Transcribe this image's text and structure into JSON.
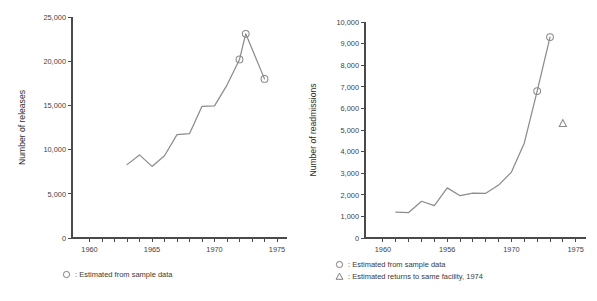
{
  "figures": [
    {
      "id": "releases",
      "legend": [
        {
          "glyph": "circle-marker-icon",
          "text": ": Estimated from sample data"
        }
      ]
    },
    {
      "id": "readmissions",
      "legend": [
        {
          "glyph": "circle-marker-icon",
          "text": ": Estimated from sample data"
        },
        {
          "glyph": "triangle-marker-icon",
          "text": ": Estimated returns to same facility, 1974"
        }
      ]
    }
  ],
  "chart_data": [
    {
      "type": "line",
      "id": "releases",
      "title": "",
      "xlabel": "Year",
      "ylabel": "Number of releases",
      "xlim": [
        1958.6,
        1975.8
      ],
      "ylim": [
        0,
        25000
      ],
      "grid": false,
      "legend_position": "below",
      "y_ticks": [
        0,
        5000,
        10000,
        15000,
        20000,
        25000
      ],
      "y_ticklabels": [
        "0",
        "5,000",
        "10,000",
        "15,000",
        "20,000",
        "25,000"
      ],
      "x_ticks": [
        1960,
        1961,
        1962,
        1963,
        1964,
        1965,
        1966,
        1967,
        1968,
        1969,
        1970,
        1971,
        1972,
        1973,
        1974,
        1975
      ],
      "x_labeled_ticks": [
        1960,
        1965,
        1970,
        1975
      ],
      "x_ticklabels": [
        "1960",
        "1965",
        "1970",
        "1975"
      ],
      "x": [
        1963,
        1964,
        1965,
        1966,
        1967,
        1968,
        1969,
        1970,
        1971,
        1972,
        1972.5,
        1974
      ],
      "values": [
        8300,
        9400,
        8100,
        9300,
        11700,
        11800,
        14900,
        14950,
        17300,
        20200,
        23100,
        18000
      ],
      "markers": [
        {
          "x": 1972,
          "y": 20200,
          "shape": "circle"
        },
        {
          "x": 1972.5,
          "y": 23100,
          "shape": "circle"
        },
        {
          "x": 1974,
          "y": 18000,
          "shape": "circle"
        }
      ]
    },
    {
      "type": "line",
      "id": "readmissions",
      "title": "",
      "xlabel": "Year",
      "ylabel": "Number of readmissions",
      "xlim": [
        1958.6,
        1975.8
      ],
      "ylim": [
        0,
        10000
      ],
      "grid": false,
      "legend_position": "below",
      "y_ticks": [
        0,
        1000,
        2000,
        3000,
        4000,
        5000,
        6000,
        7000,
        8000,
        9000,
        10000
      ],
      "y_ticklabels": [
        "0",
        "1,000",
        "2,000",
        "3,000",
        "4,000",
        "5,000",
        "6,000",
        "7,000",
        "8,000",
        "9,000",
        "10,000"
      ],
      "x_ticks": [
        1960,
        1961,
        1962,
        1963,
        1964,
        1965,
        1966,
        1967,
        1968,
        1969,
        1970,
        1971,
        1972,
        1973,
        1974,
        1975
      ],
      "x_labeled_ticks": [
        1960,
        1965,
        1970,
        1975
      ],
      "x_ticklabels": [
        "1960",
        "1956",
        "1970",
        "1975"
      ],
      "x": [
        1961,
        1962,
        1963,
        1964,
        1965,
        1966,
        1967,
        1968,
        1969,
        1970,
        1971,
        1972,
        1973
      ],
      "values": [
        1200,
        1180,
        1700,
        1500,
        2320,
        1960,
        2080,
        2070,
        2450,
        3050,
        4400,
        6800,
        9300
      ],
      "markers": [
        {
          "x": 1972,
          "y": 6800,
          "shape": "circle"
        },
        {
          "x": 1973,
          "y": 9300,
          "shape": "circle"
        },
        {
          "x": 1974,
          "y": 5300,
          "shape": "triangle"
        }
      ]
    }
  ]
}
